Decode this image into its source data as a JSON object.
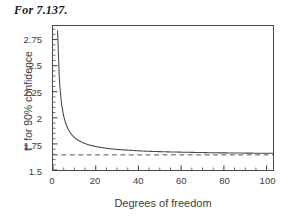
{
  "figure": {
    "caption": "For 7.137.",
    "background_color": "#ffffff",
    "frame_color": "#4a4a4a",
    "curve_color": "#4a4a4a",
    "asymptote_color": "#555555"
  },
  "chart_data": {
    "type": "line",
    "title": "For 7.137.",
    "xlabel": "Degrees of freedom",
    "ylabel": "t* for 90% confidence",
    "xlim": [
      0,
      103
    ],
    "ylim": [
      1.5,
      2.88
    ],
    "grid": false,
    "legend": null,
    "xticks": [
      0,
      20,
      40,
      60,
      80,
      100
    ],
    "xtick_labels": [
      "0",
      "20",
      "40",
      "60",
      "80",
      "100"
    ],
    "x_minor_tick_step": 5,
    "yticks": [
      1.5,
      1.75,
      2,
      2.25,
      2.5,
      2.75
    ],
    "ytick_labels": [
      "1.5",
      "1.75",
      "2",
      "2.25",
      "2.5",
      "2.75"
    ],
    "y_minor_tick_step": 0.05,
    "series": [
      {
        "name": "t* for 90% confidence",
        "style": "solid",
        "x": [
          1,
          2,
          3,
          4,
          5,
          6,
          7,
          8,
          9,
          10,
          12,
          14,
          16,
          18,
          20,
          25,
          30,
          35,
          40,
          45,
          50,
          55,
          60,
          65,
          70,
          75,
          80,
          85,
          90,
          95,
          100
        ],
        "y": [
          6.314,
          2.92,
          2.353,
          2.132,
          2.015,
          1.943,
          1.895,
          1.86,
          1.833,
          1.812,
          1.782,
          1.761,
          1.746,
          1.734,
          1.725,
          1.708,
          1.697,
          1.69,
          1.684,
          1.679,
          1.676,
          1.673,
          1.671,
          1.669,
          1.667,
          1.665,
          1.664,
          1.663,
          1.662,
          1.661,
          1.66
        ]
      },
      {
        "name": "z* asymptote",
        "style": "dashed",
        "constant_y": 1.645
      }
    ]
  }
}
